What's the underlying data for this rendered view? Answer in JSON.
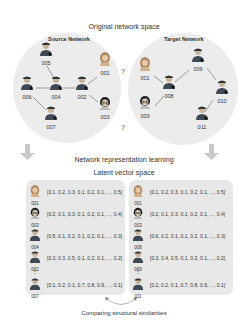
{
  "titles": {
    "original": "Original network space",
    "source_network": "Source Network",
    "target_network": "Target Network",
    "representation": "Network representation learning",
    "latent": "Latent vector space",
    "comparing": "Comparing structural similarities"
  },
  "question_mark": "?",
  "source_nodes": [
    {
      "id": "005",
      "type": "male"
    },
    {
      "id": "001",
      "type": "female"
    },
    {
      "id": "006",
      "type": "male"
    },
    {
      "id": "004",
      "type": "male"
    },
    {
      "id": "002",
      "type": "male"
    },
    {
      "id": "003",
      "type": "glasses"
    },
    {
      "id": "007",
      "type": "male"
    }
  ],
  "target_nodes": [
    {
      "id": "001",
      "type": "female"
    },
    {
      "id": "009",
      "type": "male"
    },
    {
      "id": "008",
      "type": "male"
    },
    {
      "id": "010",
      "type": "male"
    },
    {
      "id": "003",
      "type": "glasses"
    },
    {
      "id": "011",
      "type": "male"
    }
  ],
  "source_vectors": [
    {
      "id": "001",
      "vec": "[0.1, 0.2, 0.3,  0.1, 0.2, 0.1, ..., 0.5]"
    },
    {
      "id": "003",
      "vec": "[0.2, 0.1, 0.3,  0.1, 0.2, 0.1, ..., 0.4]"
    },
    {
      "id": "004",
      "vec": "[0.5, 0.1, 0.2,  0.1, 0.2, 0.1, ..., 0.3]"
    },
    {
      "id": "002",
      "vec": "[0.3, 0.3, 0.5,  0.1, 0.2, 0.1, ..., 0.2]"
    },
    {
      "id": "007",
      "vec": "[0.1, 0.2, 0.1,  0.7, 0.8, 0.9, ..., 0.1]"
    }
  ],
  "target_vectors": [
    {
      "id": "001",
      "vec": "[0.1, 0.2, 0.3,  0.1, 0.2, 0.1, ..., 0.5]"
    },
    {
      "id": "003",
      "vec": "[0.2, 0.1, 0.3,  0.1, 0.2, 0.1, ..., 0.4]"
    },
    {
      "id": "008",
      "vec": "[0.6, 0.2, 0.1,  0.1, 0.2, 0.1, ..., 0.3]"
    },
    {
      "id": "009",
      "vec": "[0.3, 0.4, 0.5,  0.1, 0.2, 0.1, ..., 0.2]"
    },
    {
      "id": "011",
      "vec": "[0.2, 0.2, 0.1,  0.7, 0.8, 0.9, ..., 0.1]"
    }
  ],
  "vertical_dots": "⋮",
  "colors": {
    "circle": "#ececec",
    "panel": "#e8e8e8",
    "arrow": "#c8c8c8",
    "person_body": "#3d4a55",
    "person_skin": "#c9b49a"
  }
}
